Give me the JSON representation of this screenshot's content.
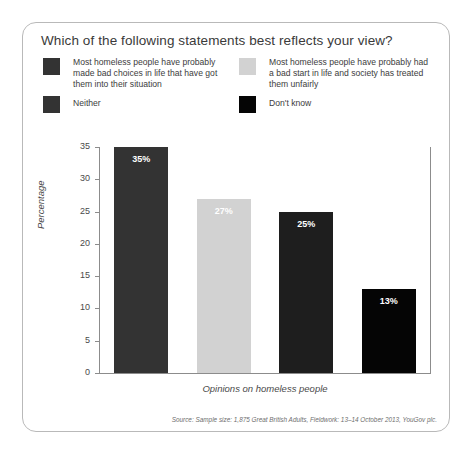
{
  "card": {
    "title": "Which of the following statements best reflects your view?",
    "source": "Source: Sample size: 1,875 Great British Adults, Fieldwork: 13–14 October 2013, YouGov plc."
  },
  "legend": {
    "left": [
      {
        "label": "Most homeless people have probably made bad choices in life that have got them into their situation",
        "color": "#333333"
      },
      {
        "label": "Neither",
        "color": "#333333"
      }
    ],
    "right": [
      {
        "label": "Most homeless people have probably had a bad start in life and society has treated them unfairly",
        "color": "#d2d2d2"
      },
      {
        "label": "Don't know",
        "color": "#050505"
      }
    ]
  },
  "chart_data": {
    "type": "bar",
    "title": "Which of the following statements best reflects your view?",
    "xlabel": "Opinions on homeless people",
    "ylabel": "Percentage",
    "ylim": [
      0,
      35
    ],
    "yticks": [
      0,
      5,
      10,
      15,
      20,
      25,
      30,
      35
    ],
    "grid": false,
    "legend_position": "top",
    "categories": [
      "Most homeless people have probably made bad choices in life that have got them into their situation",
      "Most homeless people have probably had a bad start in life and society has treated them unfairly",
      "Neither",
      "Don't know"
    ],
    "values": [
      35,
      27,
      25,
      13
    ],
    "data_labels": [
      "35%",
      "27%",
      "25%",
      "13%"
    ],
    "colors": [
      "#333333",
      "#d2d2d2",
      "#1e1e1e",
      "#050505"
    ],
    "label_colors": [
      "#ffffff",
      "#ffffff",
      "#ffffff",
      "#ffffff"
    ],
    "source": "Source: Sample size: 1,875 Great British Adults, Fieldwork: 13–14 October 2013, YouGov plc."
  }
}
